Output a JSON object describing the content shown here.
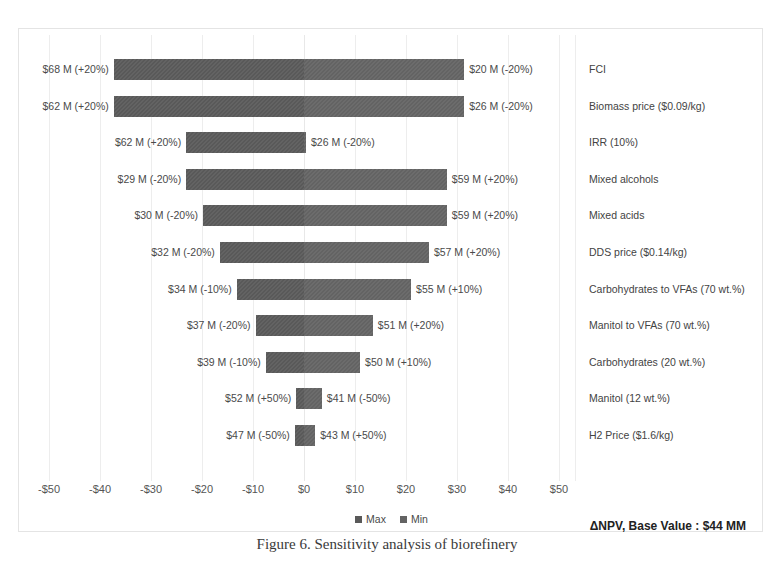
{
  "chart_data": {
    "type": "bar",
    "title": "",
    "subtitle": "",
    "xlabel": "",
    "ylabel": "",
    "xlim": [
      -50,
      50
    ],
    "grid": true,
    "orientation": "horizontal",
    "style": "tornado",
    "base_value_label": "ΔNPV, Base Value : $44 MM",
    "base_value": 44,
    "units": "$ MM",
    "legend": {
      "position": "bottom-center",
      "entries": [
        "Max",
        "Min"
      ]
    },
    "xticks": [
      -50,
      -40,
      -30,
      -20,
      -10,
      0,
      10,
      20,
      30,
      40,
      50
    ],
    "xtick_labels": [
      "-$50",
      "-$40",
      "-$30",
      "-$20",
      "-$10",
      "$0",
      "$10",
      "$20",
      "$30",
      "$40",
      "$50"
    ],
    "categories": [
      "FCI",
      "Biomass price ($0.09/kg)",
      "IRR (10%)",
      "Mixed alcohols",
      "Mixed acids",
      "DDS price ($0.14/kg)",
      "Carbohydrates to VFAs (70 wt.%)",
      "Manitol to VFAs (70 wt.%)",
      "Carbohydrates (20 wt.%)",
      "Manitol (12 wt.%)",
      "H2 Price  ($1.6/kg)"
    ],
    "series": [
      {
        "name": "Max",
        "values": [
          -37.3,
          -31.4,
          -31.4,
          -15.1,
          -14.1,
          -12.2,
          -10.2,
          -7.1,
          -5.1,
          -2.0,
          -2.0
        ]
      },
      {
        "name": "Min",
        "values": [
          31.4,
          25.5,
          1.0,
          17.6,
          17.6,
          15.7,
          12.7,
          8.6,
          6.7,
          5.1,
          3.0
        ]
      }
    ],
    "bars": [
      {
        "category": "FCI",
        "left_label": "$68 M (+20%)",
        "right_label": "$20 M (-20%)",
        "left_value": 68,
        "right_value": 20,
        "left_pct": "+20%",
        "right_pct": "-20%",
        "start": -37.3,
        "end": 31.4
      },
      {
        "category": "Biomass price ($0.09/kg)",
        "left_label": "$62 M (+20%)",
        "right_label": "$26 M (-20%)",
        "left_value": 62,
        "right_value": 26,
        "left_pct": "+20%",
        "right_pct": "-20%",
        "start": -37.3,
        "end": 31.4
      },
      {
        "category": "IRR (10%)",
        "left_label": "$62 M (+20%)",
        "right_label": "$26 M (-20%)",
        "left_value": 62,
        "right_value": 26,
        "left_pct": "+20%",
        "right_pct": "-20%",
        "start": -23.1,
        "end": 0.4
      },
      {
        "category": "Mixed alcohols",
        "left_label": "$29 M (-20%)",
        "right_label": "$59 M (+20%)",
        "left_value": 29,
        "right_value": 59,
        "left_pct": "-20%",
        "right_pct": "+20%",
        "start": -23.1,
        "end": 28.0
      },
      {
        "category": "Mixed acids",
        "left_label": "$30 M (-20%)",
        "right_label": "$59 M (+20%)",
        "left_value": 30,
        "right_value": 59,
        "left_pct": "-20%",
        "right_pct": "+20%",
        "start": -19.8,
        "end": 28.0
      },
      {
        "category": "DDS price ($0.14/kg)",
        "left_label": "$32 M (-20%)",
        "right_label": "$57 M (+20%)",
        "left_value": 32,
        "right_value": 57,
        "left_pct": "-20%",
        "right_pct": "+20%",
        "start": -16.5,
        "end": 24.5
      },
      {
        "category": "Carbohydrates to VFAs (70 wt.%)",
        "left_label": "$34 M (-10%)",
        "right_label": "$55 M (+10%)",
        "left_value": 34,
        "right_value": 55,
        "left_pct": "-10%",
        "right_pct": "+10%",
        "start": -13.2,
        "end": 21.0
      },
      {
        "category": "Manitol to VFAs (70 wt.%)",
        "left_label": "$37 M (-20%)",
        "right_label": "$51 M (+20%)",
        "left_value": 37,
        "right_value": 51,
        "left_pct": "-20%",
        "right_pct": "+20%",
        "start": -9.5,
        "end": 13.5
      },
      {
        "category": "Carbohydrates (20 wt.%)",
        "left_label": "$39 M (-10%)",
        "right_label": "$50 M (+10%)",
        "left_value": 39,
        "right_value": 50,
        "left_pct": "-10%",
        "right_pct": "+10%",
        "start": -7.5,
        "end": 11.0
      },
      {
        "category": "Manitol (12 wt.%)",
        "left_label": "$52 M (+50%)",
        "right_label": "$41 M (-50%)",
        "left_value": 52,
        "right_value": 41,
        "left_pct": "+50%",
        "right_pct": "-50%",
        "start": -1.5,
        "end": 3.5
      },
      {
        "category": "H2 Price  ($1.6/kg)",
        "left_label": "$47 M (-50%)",
        "right_label": "$43 M (+50%)",
        "left_value": 47,
        "right_value": 43,
        "left_pct": "-50%",
        "right_pct": "+50%",
        "start": -1.8,
        "end": 2.2
      }
    ],
    "colors": {
      "max": "#595959",
      "min": "#636363",
      "grid": "#ededed",
      "border": "#e4e4e4"
    }
  },
  "caption": {
    "text": "Figure 6. Sensitivity analysis of biorefinery"
  }
}
